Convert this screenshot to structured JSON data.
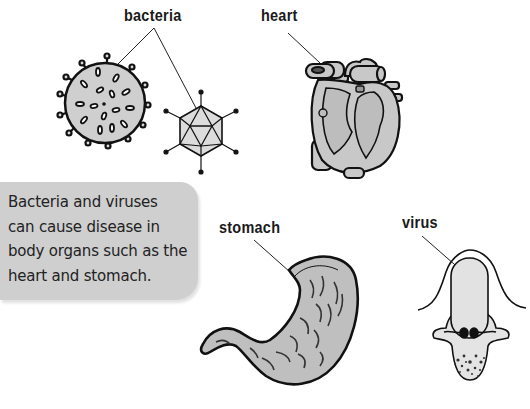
{
  "labels": {
    "bacteria": "bacteria",
    "heart": "heart",
    "stomach": "stomach",
    "virus": "virus"
  },
  "callout": {
    "text": "Bacteria and viruses\ncan cause disease in\nbody organs such as the\nheart and stomach."
  },
  "colors": {
    "callout_bg": "#cfcfcf",
    "organ_fill": "#c4c4c4",
    "outline": "#111111"
  },
  "illustrations": [
    "bacteria-sphere",
    "bacteria-icosahedron",
    "heart-cross-section",
    "stomach",
    "virus-in-cell"
  ]
}
